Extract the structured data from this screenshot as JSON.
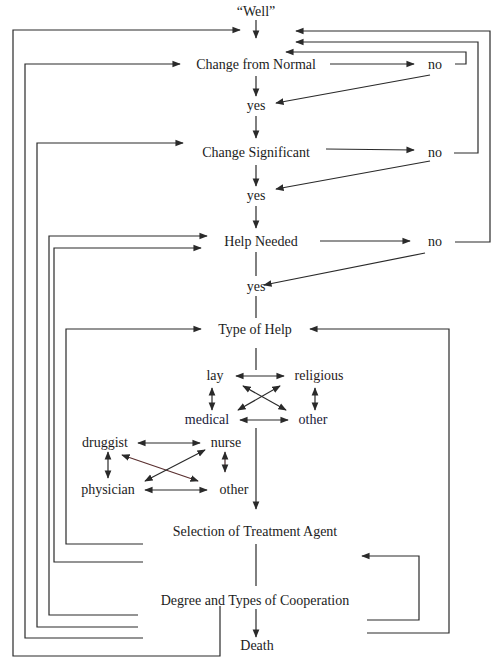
{
  "diagram": {
    "nodes": {
      "well": "“Well”",
      "change_from_normal": "Change from Normal",
      "no1": "no",
      "yes1": "yes",
      "change_significant": "Change Significant",
      "no2": "no",
      "yes2": "yes",
      "help_needed": "Help Needed",
      "no3": "no",
      "yes3": "yes",
      "type_of_help": "Type of Help",
      "lay": "lay",
      "religious": "religious",
      "medical": "medical",
      "other1": "other",
      "druggist": "druggist",
      "nurse": "nurse",
      "physician": "physician",
      "other2": "other",
      "selection_of_treatment_agent": "Selection of Treatment Agent",
      "degree_and_types_of_cooperation": "Degree and Types of Cooperation",
      "death": "Death"
    },
    "edges": [
      {
        "from": "well",
        "to": "change_from_normal",
        "type": "arrow"
      },
      {
        "from": "change_from_normal",
        "to": "yes1",
        "type": "arrow"
      },
      {
        "from": "change_from_normal",
        "to": "no1",
        "type": "arrow"
      },
      {
        "from": "no1",
        "to": "yes1",
        "type": "arrow"
      },
      {
        "from": "no1",
        "to": "change_from_normal",
        "type": "loop-arrow"
      },
      {
        "from": "yes1",
        "to": "change_significant",
        "type": "arrow"
      },
      {
        "from": "change_significant",
        "to": "no2",
        "type": "arrow"
      },
      {
        "from": "no2",
        "to": "yes2",
        "type": "arrow"
      },
      {
        "from": "no2",
        "to": "well",
        "type": "loop-arrow"
      },
      {
        "from": "change_significant",
        "to": "yes2",
        "type": "arrow"
      },
      {
        "from": "yes2",
        "to": "help_needed",
        "type": "arrow"
      },
      {
        "from": "help_needed",
        "to": "no3",
        "type": "arrow"
      },
      {
        "from": "no3",
        "to": "yes3",
        "type": "arrow"
      },
      {
        "from": "no3",
        "to": "well",
        "type": "loop-arrow"
      },
      {
        "from": "help_needed",
        "to": "yes3",
        "type": "line"
      },
      {
        "from": "yes3",
        "to": "type_of_help",
        "type": "line"
      },
      {
        "from": "type_of_help",
        "to": "lay-religious-medical-other",
        "type": "line"
      },
      {
        "from": "lay",
        "to": "religious",
        "type": "bidirectional"
      },
      {
        "from": "lay",
        "to": "medical",
        "type": "bidirectional"
      },
      {
        "from": "lay",
        "to": "other1",
        "type": "bidirectional"
      },
      {
        "from": "religious",
        "to": "medical",
        "type": "bidirectional"
      },
      {
        "from": "religious",
        "to": "other1",
        "type": "bidirectional"
      },
      {
        "from": "medical",
        "to": "other1",
        "type": "bidirectional"
      },
      {
        "from": "druggist",
        "to": "nurse",
        "type": "bidirectional"
      },
      {
        "from": "druggist",
        "to": "physician",
        "type": "bidirectional"
      },
      {
        "from": "druggist",
        "to": "other2",
        "type": "bidirectional"
      },
      {
        "from": "nurse",
        "to": "physician",
        "type": "bidirectional"
      },
      {
        "from": "nurse",
        "to": "other2",
        "type": "bidirectional"
      },
      {
        "from": "physician",
        "to": "other2",
        "type": "bidirectional"
      },
      {
        "from": "medical",
        "to": "selection_of_treatment_agent",
        "type": "arrow"
      },
      {
        "from": "selection_of_treatment_agent",
        "to": "degree_and_types_of_cooperation",
        "type": "line"
      },
      {
        "from": "degree_and_types_of_cooperation",
        "to": "death",
        "type": "arrow"
      },
      {
        "from": "degree_and_types_of_cooperation",
        "to": "selection_of_treatment_agent",
        "type": "loop-arrow"
      },
      {
        "from": "degree_and_types_of_cooperation",
        "to": "type_of_help",
        "type": "loop-arrow"
      },
      {
        "from": "selection_of_treatment_agent",
        "to": "type_of_help",
        "type": "loop-arrow"
      },
      {
        "from": "selection_of_treatment_agent",
        "to": "help_needed",
        "type": "loop-arrow"
      },
      {
        "from": "degree_and_types_of_cooperation",
        "to": "help_needed",
        "type": "loop-arrow"
      },
      {
        "from": "degree_and_types_of_cooperation",
        "to": "change_significant",
        "type": "loop-arrow"
      },
      {
        "from": "degree_and_types_of_cooperation",
        "to": "change_from_normal",
        "type": "loop-arrow"
      },
      {
        "from": "degree_and_types_of_cooperation",
        "to": "well",
        "type": "loop-arrow"
      }
    ]
  }
}
